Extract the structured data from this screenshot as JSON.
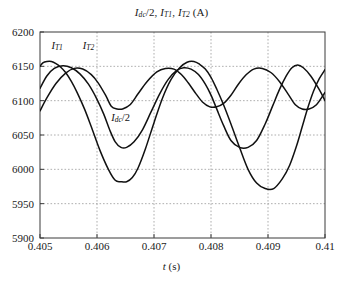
{
  "figure": {
    "title_plain": "Idc/2, IT1, IT2 (A)",
    "xlabel_plain": "t (s)",
    "background": "#ffffff",
    "curve_color": "#111111",
    "grid_color": "#9a9a9a",
    "axis_color": "#3a3a3a"
  },
  "labels": {
    "it1": "I",
    "it1_sub": "T1",
    "it2": "I",
    "it2_sub": "T2",
    "idc": "I",
    "idc_sub": "dc",
    "idc_tail": "/2"
  },
  "title_parts": {
    "i1": "I",
    "i1_sub": "dc",
    "i1_tail": "/2, ",
    "i2": "I",
    "i2_sub": "T1",
    "i2_tail": ", ",
    "i3": "I",
    "i3_sub": "T2",
    "i3_tail": " (A)"
  },
  "axis": {
    "x_label_italic": "t",
    "x_label_unit": " (s)",
    "yticks": [
      "5900",
      "5950",
      "6000",
      "6050",
      "6100",
      "6150",
      "6200"
    ],
    "xticks": [
      "0.405",
      "0.406",
      "0.407",
      "0.408",
      "0.409",
      "0.41"
    ]
  },
  "chart_data": {
    "type": "line",
    "title": "Idc/2, IT1, IT2 (A)",
    "xlabel": "t (s)",
    "ylabel": "Idc/2, IT1, IT2 (A)",
    "xlim": [
      0.405,
      0.41
    ],
    "ylim": [
      5900,
      6200
    ],
    "xticks": [
      0.405,
      0.406,
      0.407,
      0.408,
      0.409,
      0.41
    ],
    "yticks": [
      5900,
      5950,
      6000,
      6050,
      6100,
      6150,
      6200
    ],
    "grid": true,
    "legend": "inline-annotations",
    "annotations": [
      {
        "text": "IT1",
        "x": 0.4052,
        "y": 6178
      },
      {
        "text": "IT2",
        "x": 0.40575,
        "y": 6178
      },
      {
        "text": "Idc/2",
        "x": 0.40625,
        "y": 6073
      }
    ],
    "series": [
      {
        "name": "IT1",
        "x": [
          0.405,
          0.40505,
          0.40512,
          0.4052,
          0.40528,
          0.40536,
          0.40545,
          0.40555,
          0.40565,
          0.40578,
          0.4059,
          0.40605,
          0.4062,
          0.40632,
          0.40642,
          0.40652,
          0.40662,
          0.40672,
          0.40685,
          0.407,
          0.40715,
          0.4073,
          0.40745,
          0.40758,
          0.4077,
          0.4078,
          0.4079,
          0.408,
          0.4081,
          0.40822,
          0.40835,
          0.4085,
          0.40865,
          0.4088,
          0.40895,
          0.4091,
          0.40925,
          0.40938,
          0.4095,
          0.4096,
          0.4097,
          0.4098,
          0.4099,
          0.41
        ],
        "y": [
          6150,
          6155,
          6157,
          6157,
          6154,
          6149,
          6141,
          6128,
          6112,
          6088,
          6062,
          6028,
          6000,
          5984,
          5982,
          5982,
          5988,
          6002,
          6030,
          6068,
          6104,
          6131,
          6148,
          6156,
          6157,
          6153,
          6146,
          6134,
          6117,
          6094,
          6066,
          6032,
          6000,
          5980,
          5972,
          5972,
          5986,
          6006,
          6034,
          6062,
          6090,
          6114,
          6132,
          6145
        ]
      },
      {
        "name": "IT2",
        "x": [
          0.405,
          0.40512,
          0.40525,
          0.4054,
          0.40555,
          0.4057,
          0.40585,
          0.406,
          0.40612,
          0.40622,
          0.40632,
          0.40642,
          0.40652,
          0.40665,
          0.4068,
          0.40695,
          0.4071,
          0.40725,
          0.4074,
          0.40752,
          0.40765,
          0.40778,
          0.4079,
          0.408,
          0.4081,
          0.40822,
          0.40835,
          0.4085,
          0.40865,
          0.4088,
          0.40895,
          0.40908,
          0.4092,
          0.40932,
          0.40942,
          0.40952,
          0.40962,
          0.40975,
          0.4099,
          0.41
        ],
        "y": [
          6118,
          6136,
          6147,
          6151,
          6148,
          6139,
          6124,
          6102,
          6080,
          6058,
          6040,
          6032,
          6032,
          6040,
          6058,
          6084,
          6110,
          6131,
          6144,
          6148,
          6146,
          6138,
          6124,
          6108,
          6088,
          6064,
          6042,
          6032,
          6032,
          6042,
          6066,
          6092,
          6116,
          6136,
          6148,
          6152,
          6148,
          6136,
          6116,
          6100
        ]
      },
      {
        "name": "Idc/2",
        "x": [
          0.405,
          0.40512,
          0.40528,
          0.40545,
          0.4056,
          0.40575,
          0.4059,
          0.40602,
          0.40615,
          0.40625,
          0.40635,
          0.40645,
          0.40658,
          0.40672,
          0.40688,
          0.40705,
          0.4072,
          0.40735,
          0.40748,
          0.4076,
          0.40772,
          0.40785,
          0.40798,
          0.4081,
          0.40822,
          0.40835,
          0.40848,
          0.40862,
          0.40875,
          0.4089,
          0.40905,
          0.4092,
          0.40935,
          0.40948,
          0.4096,
          0.40972,
          0.40985,
          0.41
        ],
        "y": [
          6085,
          6104,
          6125,
          6140,
          6147,
          6146,
          6138,
          6126,
          6108,
          6092,
          6088,
          6088,
          6094,
          6110,
          6128,
          6142,
          6147,
          6146,
          6138,
          6126,
          6112,
          6098,
          6091,
          6091,
          6096,
          6108,
          6124,
          6138,
          6146,
          6147,
          6141,
          6128,
          6110,
          6094,
          6088,
          6088,
          6094,
          6112
        ]
      }
    ]
  },
  "geometry": {
    "plot_left": 40,
    "plot_right": 325,
    "plot_top": 32,
    "plot_bottom": 238
  }
}
